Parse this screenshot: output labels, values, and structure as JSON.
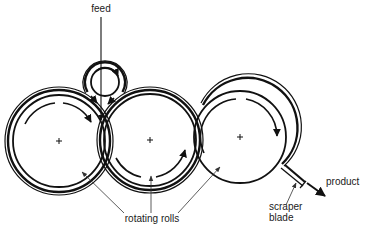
{
  "diagram": {
    "title": "",
    "labels": {
      "feed": "feed",
      "rotating_rolls": "rotating rolls",
      "scraper_line1": "scraper",
      "scraper_line2": "blade",
      "product": "product"
    },
    "components": [
      {
        "id": "roll-left",
        "type": "rotating roll",
        "rotation": "clockwise"
      },
      {
        "id": "roll-middle",
        "type": "rotating roll",
        "rotation": "counter-clockwise"
      },
      {
        "id": "roll-right",
        "type": "rotating roll",
        "rotation": "clockwise"
      },
      {
        "id": "roll-feed",
        "type": "feed roll",
        "rotation": "clockwise"
      },
      {
        "id": "scraper-blade",
        "type": "scraper blade"
      }
    ],
    "flows": [
      {
        "from": "feed",
        "to": "nip between left and middle rolls"
      },
      {
        "from": "roll-right",
        "to": "product",
        "via": "scraper-blade"
      }
    ],
    "colors": {
      "line": "#111111",
      "background": "#ffffff"
    }
  }
}
